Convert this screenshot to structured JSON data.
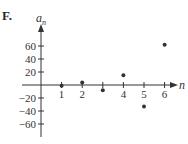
{
  "panel": {
    "label": "F."
  },
  "chart_data": {
    "type": "scatter",
    "title": "",
    "xlabel": "n",
    "ylabel": "a_n",
    "x": [
      1,
      2,
      3,
      4,
      5,
      6
    ],
    "values": [
      -1,
      4,
      -8,
      15,
      -33,
      62
    ],
    "x_tick_labels": [
      "1",
      "2",
      "4",
      "5",
      "6"
    ],
    "x_ticks": [
      1,
      2,
      3,
      4,
      5,
      6
    ],
    "y_ticks": [
      60,
      40,
      20,
      -20,
      -40,
      -60
    ],
    "y_tick_labels": [
      "60",
      "40",
      "20",
      "−20",
      "−40",
      "−60"
    ],
    "xlim": [
      0,
      6.5
    ],
    "ylim": [
      -75,
      80
    ],
    "grid": false,
    "legend": null
  }
}
